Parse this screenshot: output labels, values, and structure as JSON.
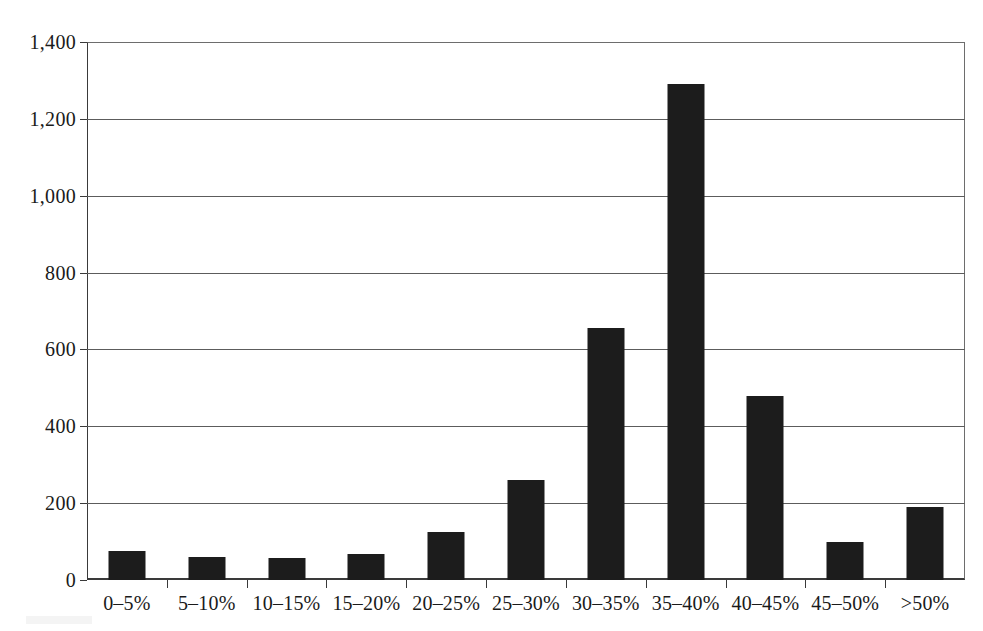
{
  "chart_data": {
    "type": "bar",
    "title": "",
    "subtitle": "",
    "xlabel": "",
    "ylabel": "",
    "categories": [
      "0–5%",
      "5–10%",
      "10–15%",
      "15–20%",
      "20–25%",
      "25–30%",
      "30–35%",
      "35–40%",
      "40–45%",
      "45–50%",
      ">50%"
    ],
    "values": [
      75,
      60,
      58,
      67,
      125,
      260,
      655,
      1290,
      478,
      100,
      190
    ],
    "series": [
      {
        "name": "Count",
        "values": [
          75,
          60,
          58,
          67,
          125,
          260,
          655,
          1290,
          478,
          100,
          190
        ]
      }
    ],
    "ylim": [
      0,
      1400
    ],
    "ytick_values": [
      0,
      200,
      400,
      600,
      800,
      1000,
      1200,
      1400
    ],
    "ytick_labels": [
      "0",
      "200",
      "400",
      "600",
      "800",
      "1,000",
      "1,200",
      "1,400"
    ],
    "grid": "horizontal",
    "legend": "none",
    "bar_color": "#1c1c1c",
    "axis_color": "#3a3a3a",
    "gridline_color": "#5c5c5c",
    "background_color": "#ffffff",
    "annotations": []
  }
}
